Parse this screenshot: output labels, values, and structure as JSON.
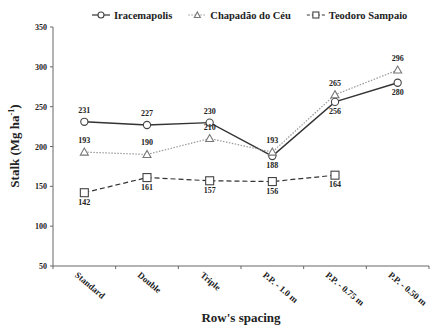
{
  "chart_data": {
    "type": "line",
    "title": "",
    "xlabel": "Row's spacing",
    "ylabel": "Stalk (Mg ha-1)",
    "ylabel_main": "Stalk (Mg ha",
    "ylabel_sup": "-1",
    "ylabel_close": ")",
    "ylim": [
      50,
      350
    ],
    "yticks": [
      50,
      100,
      150,
      200,
      250,
      300,
      350
    ],
    "grid": false,
    "legend_position": "top",
    "categories": [
      "Standard",
      "Double",
      "Triple",
      "P.P. - 1.0 m",
      "P.P. - 0.75 m",
      "P.P. - 0.50 m"
    ],
    "series": [
      {
        "name": "Iracemapolis",
        "marker": "circle",
        "line": "solid",
        "color": "#333333",
        "values": [
          231,
          227,
          230,
          188,
          256,
          280
        ]
      },
      {
        "name": "Chapadão do Céu",
        "marker": "triangle",
        "line": "dotted",
        "color": "#999999",
        "values": [
          193,
          190,
          210,
          193,
          265,
          296
        ]
      },
      {
        "name": "Teodoro Sampaio",
        "marker": "square",
        "line": "dashed",
        "color": "#333333",
        "values": [
          142,
          161,
          157,
          156,
          164,
          null
        ]
      }
    ]
  }
}
